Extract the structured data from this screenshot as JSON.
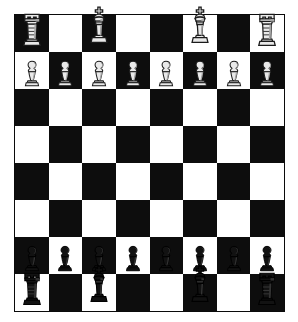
{
  "diagram": {
    "kind": "chessboard",
    "files": [
      "a",
      "b",
      "c",
      "d",
      "e",
      "f",
      "g",
      "h"
    ],
    "ranks": [
      "8",
      "7",
      "6",
      "5",
      "4",
      "3",
      "2",
      "1"
    ],
    "colors": {
      "dark_square": "#0d0d0d",
      "light_square": "#ffffff",
      "border": "#0a0a0a",
      "page_background": "#ffffff",
      "white_piece_body": "#e9e9e9",
      "black_piece_body": "#121212"
    },
    "orientation_note": "a8 corner square is dark",
    "board": [
      [
        {
          "square": "a8",
          "shade": "dark",
          "piece": "rook",
          "side": "white",
          "glyph": "♖"
        },
        {
          "square": "b8",
          "shade": "light",
          "piece": null,
          "side": null,
          "glyph": ""
        },
        {
          "square": "c8",
          "shade": "dark",
          "piece": "king",
          "side": "white",
          "glyph": "♔"
        },
        {
          "square": "d8",
          "shade": "light",
          "piece": null,
          "side": null,
          "glyph": ""
        },
        {
          "square": "e8",
          "shade": "dark",
          "piece": null,
          "side": null,
          "glyph": ""
        },
        {
          "square": "f8",
          "shade": "light",
          "piece": "king",
          "side": "white",
          "glyph": "♔"
        },
        {
          "square": "g8",
          "shade": "dark",
          "piece": null,
          "side": null,
          "glyph": ""
        },
        {
          "square": "h8",
          "shade": "light",
          "piece": "rook",
          "side": "white",
          "glyph": "♖"
        }
      ],
      [
        {
          "square": "a7",
          "shade": "light",
          "piece": "pawn",
          "side": "white",
          "glyph": "♙"
        },
        {
          "square": "b7",
          "shade": "dark",
          "piece": "pawn",
          "side": "white",
          "glyph": "♙"
        },
        {
          "square": "c7",
          "shade": "light",
          "piece": "pawn",
          "side": "white",
          "glyph": "♙"
        },
        {
          "square": "d7",
          "shade": "dark",
          "piece": "pawn",
          "side": "white",
          "glyph": "♙"
        },
        {
          "square": "e7",
          "shade": "light",
          "piece": "pawn",
          "side": "white",
          "glyph": "♙"
        },
        {
          "square": "f7",
          "shade": "dark",
          "piece": "pawn",
          "side": "white",
          "glyph": "♙"
        },
        {
          "square": "g7",
          "shade": "light",
          "piece": "pawn",
          "side": "white",
          "glyph": "♙"
        },
        {
          "square": "h7",
          "shade": "dark",
          "piece": "pawn",
          "side": "white",
          "glyph": "♙"
        }
      ],
      [
        {
          "square": "a6",
          "shade": "dark",
          "piece": null,
          "side": null,
          "glyph": ""
        },
        {
          "square": "b6",
          "shade": "light",
          "piece": null,
          "side": null,
          "glyph": ""
        },
        {
          "square": "c6",
          "shade": "dark",
          "piece": null,
          "side": null,
          "glyph": ""
        },
        {
          "square": "d6",
          "shade": "light",
          "piece": null,
          "side": null,
          "glyph": ""
        },
        {
          "square": "e6",
          "shade": "dark",
          "piece": null,
          "side": null,
          "glyph": ""
        },
        {
          "square": "f6",
          "shade": "light",
          "piece": null,
          "side": null,
          "glyph": ""
        },
        {
          "square": "g6",
          "shade": "dark",
          "piece": null,
          "side": null,
          "glyph": ""
        },
        {
          "square": "h6",
          "shade": "light",
          "piece": null,
          "side": null,
          "glyph": ""
        }
      ],
      [
        {
          "square": "a5",
          "shade": "light",
          "piece": null,
          "side": null,
          "glyph": ""
        },
        {
          "square": "b5",
          "shade": "dark",
          "piece": null,
          "side": null,
          "glyph": ""
        },
        {
          "square": "c5",
          "shade": "light",
          "piece": null,
          "side": null,
          "glyph": ""
        },
        {
          "square": "d5",
          "shade": "dark",
          "piece": null,
          "side": null,
          "glyph": ""
        },
        {
          "square": "e5",
          "shade": "light",
          "piece": null,
          "side": null,
          "glyph": ""
        },
        {
          "square": "f5",
          "shade": "dark",
          "piece": null,
          "side": null,
          "glyph": ""
        },
        {
          "square": "g5",
          "shade": "light",
          "piece": null,
          "side": null,
          "glyph": ""
        },
        {
          "square": "h5",
          "shade": "dark",
          "piece": null,
          "side": null,
          "glyph": ""
        }
      ],
      [
        {
          "square": "a4",
          "shade": "dark",
          "piece": null,
          "side": null,
          "glyph": ""
        },
        {
          "square": "b4",
          "shade": "light",
          "piece": null,
          "side": null,
          "glyph": ""
        },
        {
          "square": "c4",
          "shade": "dark",
          "piece": null,
          "side": null,
          "glyph": ""
        },
        {
          "square": "d4",
          "shade": "light",
          "piece": null,
          "side": null,
          "glyph": ""
        },
        {
          "square": "e4",
          "shade": "dark",
          "piece": null,
          "side": null,
          "glyph": ""
        },
        {
          "square": "f4",
          "shade": "light",
          "piece": null,
          "side": null,
          "glyph": ""
        },
        {
          "square": "g4",
          "shade": "dark",
          "piece": null,
          "side": null,
          "glyph": ""
        },
        {
          "square": "h4",
          "shade": "light",
          "piece": null,
          "side": null,
          "glyph": ""
        }
      ],
      [
        {
          "square": "a3",
          "shade": "light",
          "piece": null,
          "side": null,
          "glyph": ""
        },
        {
          "square": "b3",
          "shade": "dark",
          "piece": null,
          "side": null,
          "glyph": ""
        },
        {
          "square": "c3",
          "shade": "light",
          "piece": null,
          "side": null,
          "glyph": ""
        },
        {
          "square": "d3",
          "shade": "dark",
          "piece": null,
          "side": null,
          "glyph": ""
        },
        {
          "square": "e3",
          "shade": "light",
          "piece": null,
          "side": null,
          "glyph": ""
        },
        {
          "square": "f3",
          "shade": "dark",
          "piece": null,
          "side": null,
          "glyph": ""
        },
        {
          "square": "g3",
          "shade": "light",
          "piece": null,
          "side": null,
          "glyph": ""
        },
        {
          "square": "h3",
          "shade": "dark",
          "piece": null,
          "side": null,
          "glyph": ""
        }
      ],
      [
        {
          "square": "a2",
          "shade": "dark",
          "piece": "pawn",
          "side": "black",
          "glyph": "♟"
        },
        {
          "square": "b2",
          "shade": "light",
          "piece": "pawn",
          "side": "black",
          "glyph": "♟"
        },
        {
          "square": "c2",
          "shade": "dark",
          "piece": "pawn",
          "side": "black",
          "glyph": "♟"
        },
        {
          "square": "d2",
          "shade": "light",
          "piece": "pawn",
          "side": "black",
          "glyph": "♟"
        },
        {
          "square": "e2",
          "shade": "dark",
          "piece": "pawn",
          "side": "black",
          "glyph": "♟"
        },
        {
          "square": "f2",
          "shade": "light",
          "piece": "pawn",
          "side": "black",
          "glyph": "♟"
        },
        {
          "square": "g2",
          "shade": "dark",
          "piece": "pawn",
          "side": "black",
          "glyph": "♟"
        },
        {
          "square": "h2",
          "shade": "light",
          "piece": "pawn",
          "side": "black",
          "glyph": "♟"
        }
      ],
      [
        {
          "square": "a1",
          "shade": "light",
          "piece": "rook",
          "side": "black",
          "glyph": "♜"
        },
        {
          "square": "b1",
          "shade": "dark",
          "piece": null,
          "side": null,
          "glyph": ""
        },
        {
          "square": "c1",
          "shade": "light",
          "piece": "king",
          "side": "black",
          "glyph": "♚"
        },
        {
          "square": "d1",
          "shade": "dark",
          "piece": null,
          "side": null,
          "glyph": ""
        },
        {
          "square": "e1",
          "shade": "light",
          "piece": null,
          "side": null,
          "glyph": ""
        },
        {
          "square": "f1",
          "shade": "dark",
          "piece": "king",
          "side": "black",
          "glyph": "♚"
        },
        {
          "square": "g1",
          "shade": "light",
          "piece": null,
          "side": null,
          "glyph": ""
        },
        {
          "square": "h1",
          "shade": "dark",
          "piece": "rook",
          "side": "black",
          "glyph": "♜"
        }
      ]
    ]
  }
}
